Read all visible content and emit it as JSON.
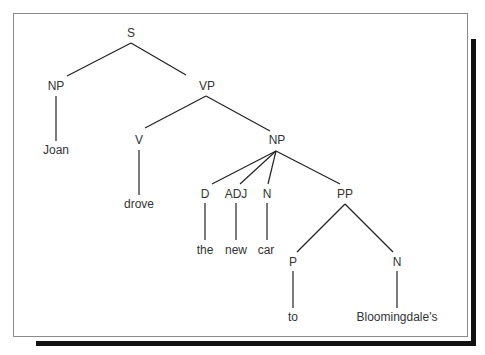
{
  "diagram": {
    "type": "syntax-parse-tree",
    "sentence": "Joan drove the new car to Bloomingdale's",
    "nodes": [
      {
        "id": "s",
        "label": "S",
        "x": 131,
        "y": 33
      },
      {
        "id": "np1",
        "label": "NP",
        "x": 56,
        "y": 86
      },
      {
        "id": "vp",
        "label": "VP",
        "x": 207,
        "y": 86
      },
      {
        "id": "joan",
        "label": "Joan",
        "x": 56,
        "y": 150
      },
      {
        "id": "v",
        "label": "V",
        "x": 139,
        "y": 140
      },
      {
        "id": "np2",
        "label": "NP",
        "x": 277,
        "y": 140
      },
      {
        "id": "drove",
        "label": "drove",
        "x": 139,
        "y": 204
      },
      {
        "id": "d",
        "label": "D",
        "x": 205,
        "y": 194
      },
      {
        "id": "adj",
        "label": "ADJ",
        "x": 236,
        "y": 194
      },
      {
        "id": "n1",
        "label": "N",
        "x": 267,
        "y": 194
      },
      {
        "id": "pp",
        "label": "PP",
        "x": 345,
        "y": 194
      },
      {
        "id": "the",
        "label": "the",
        "x": 205,
        "y": 250
      },
      {
        "id": "new",
        "label": "new",
        "x": 236,
        "y": 250
      },
      {
        "id": "car",
        "label": "car",
        "x": 266,
        "y": 250
      },
      {
        "id": "p",
        "label": "P",
        "x": 293,
        "y": 262
      },
      {
        "id": "n2",
        "label": "N",
        "x": 397,
        "y": 262
      },
      {
        "id": "to",
        "label": "to",
        "x": 293,
        "y": 317
      },
      {
        "id": "bloomingdales",
        "label": "Bloomingdale's",
        "x": 397,
        "y": 317
      }
    ],
    "edges": [
      [
        "s",
        "np1"
      ],
      [
        "s",
        "vp"
      ],
      [
        "np1",
        "joan"
      ],
      [
        "vp",
        "v"
      ],
      [
        "vp",
        "np2"
      ],
      [
        "v",
        "drove"
      ],
      [
        "np2",
        "d"
      ],
      [
        "np2",
        "adj"
      ],
      [
        "np2",
        "n1"
      ],
      [
        "np2",
        "pp"
      ],
      [
        "d",
        "the"
      ],
      [
        "adj",
        "new"
      ],
      [
        "n1",
        "car"
      ],
      [
        "pp",
        "p"
      ],
      [
        "pp",
        "n2"
      ],
      [
        "p",
        "to"
      ],
      [
        "n2",
        "bloomingdales"
      ]
    ],
    "line_color": "#222222",
    "text_color": "#333333",
    "frame_border_color": "#8a8a8a",
    "shadow_color": "#111111"
  }
}
